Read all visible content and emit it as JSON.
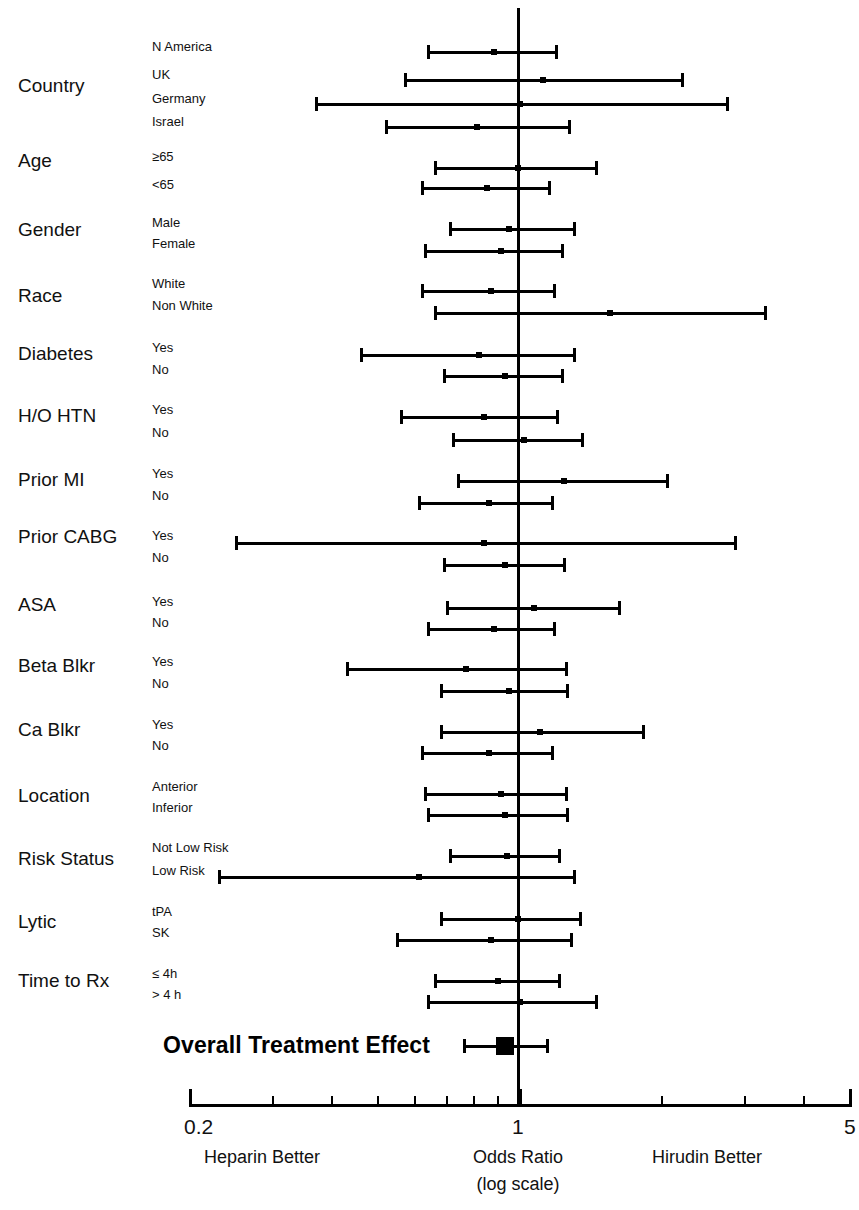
{
  "figure": {
    "title": "",
    "overall_label": "Overall Treatment Effect",
    "axis": {
      "scale": "log",
      "min": 0.2,
      "max": 5,
      "left_tick_label": "0.2",
      "center_tick_label": "1",
      "right_tick_label": "5",
      "ticks": [
        0.2,
        0.3,
        0.4,
        0.5,
        0.6,
        0.7,
        0.8,
        0.9,
        1,
        2,
        3,
        4,
        5
      ],
      "major_ticks": [
        0.2,
        1,
        5
      ],
      "caption_left": "Heparin Better",
      "caption_center": "Odds Ratio",
      "caption_center2": "(log scale)",
      "caption_right": "Hirudin Better",
      "reference_line": 1
    },
    "groups": [
      {
        "label": "Country",
        "strata": [
          "N America",
          "UK",
          "Germany",
          "Israel"
        ]
      },
      {
        "label": "Age",
        "strata": [
          "≥65",
          "<65"
        ]
      },
      {
        "label": "Gender",
        "strata": [
          "Male",
          "Female"
        ]
      },
      {
        "label": "Race",
        "strata": [
          "White",
          "Non White"
        ]
      },
      {
        "label": "Diabetes",
        "strata": [
          "Yes",
          "No"
        ]
      },
      {
        "label": "H/O HTN",
        "strata": [
          "Yes",
          "No"
        ]
      },
      {
        "label": "Prior MI",
        "strata": [
          "Yes",
          "No"
        ]
      },
      {
        "label": "Prior CABG",
        "strata": [
          "Yes",
          "No"
        ]
      },
      {
        "label": "ASA",
        "strata": [
          "Yes",
          "No"
        ]
      },
      {
        "label": "Beta Blkr",
        "strata": [
          "Yes",
          "No"
        ]
      },
      {
        "label": "Ca Blkr",
        "strata": [
          "Yes",
          "No"
        ]
      },
      {
        "label": "Location",
        "strata": [
          "Anterior",
          "Inferior"
        ]
      },
      {
        "label": "Risk Status",
        "strata": [
          "Not Low Risk",
          "Low Risk"
        ]
      },
      {
        "label": "Lytic",
        "strata": [
          "tPA",
          "SK"
        ]
      },
      {
        "label": "Time to Rx",
        "strata": [
          "≤ 4h",
          "> 4 h"
        ]
      }
    ]
  },
  "chart_data": {
    "type": "forest",
    "title": "",
    "xlabel": "Odds Ratio (log scale)",
    "ylabel": "",
    "xscale": "log",
    "xlim": [
      0.2,
      5
    ],
    "reference_line": 1,
    "left_direction_label": "Heparin Better",
    "right_direction_label": "Hirudin Better",
    "grid": false,
    "legend": "none",
    "columns": [
      "group",
      "stratum",
      "odds_ratio",
      "ci_low",
      "ci_high",
      "marker_size"
    ],
    "rows": [
      {
        "group": "Country",
        "stratum": "N America",
        "odds_ratio": 0.88,
        "ci_low": 0.64,
        "ci_high": 1.19,
        "marker_size": 3
      },
      {
        "group": "Country",
        "stratum": "UK",
        "odds_ratio": 1.12,
        "ci_low": 0.57,
        "ci_high": 2.2,
        "marker_size": 3
      },
      {
        "group": "Country",
        "stratum": "Germany",
        "odds_ratio": 1.0,
        "ci_low": 0.37,
        "ci_high": 2.75,
        "marker_size": 3
      },
      {
        "group": "Country",
        "stratum": "Israel",
        "odds_ratio": 0.81,
        "ci_low": 0.52,
        "ci_high": 1.27,
        "marker_size": 3
      },
      {
        "group": "Age",
        "stratum": "≥65",
        "odds_ratio": 0.99,
        "ci_low": 0.66,
        "ci_high": 1.45,
        "marker_size": 3
      },
      {
        "group": "Age",
        "stratum": "<65",
        "odds_ratio": 0.85,
        "ci_low": 0.62,
        "ci_high": 1.15,
        "marker_size": 3
      },
      {
        "group": "Gender",
        "stratum": "Male",
        "odds_ratio": 0.95,
        "ci_low": 0.71,
        "ci_high": 1.3,
        "marker_size": 3
      },
      {
        "group": "Gender",
        "stratum": "Female",
        "odds_ratio": 0.91,
        "ci_low": 0.63,
        "ci_high": 1.23,
        "marker_size": 3
      },
      {
        "group": "Race",
        "stratum": "White",
        "odds_ratio": 0.87,
        "ci_low": 0.62,
        "ci_high": 1.18,
        "marker_size": 3
      },
      {
        "group": "Race",
        "stratum": "Non White",
        "odds_ratio": 1.55,
        "ci_low": 0.66,
        "ci_high": 3.3,
        "marker_size": 3
      },
      {
        "group": "Diabetes",
        "stratum": "Yes",
        "odds_ratio": 0.82,
        "ci_low": 0.46,
        "ci_high": 1.3,
        "marker_size": 3
      },
      {
        "group": "Diabetes",
        "stratum": "No",
        "odds_ratio": 0.93,
        "ci_low": 0.69,
        "ci_high": 1.23,
        "marker_size": 3
      },
      {
        "group": "H/O HTN",
        "stratum": "Yes",
        "odds_ratio": 0.84,
        "ci_low": 0.56,
        "ci_high": 1.2,
        "marker_size": 3
      },
      {
        "group": "H/O HTN",
        "stratum": "No",
        "odds_ratio": 1.02,
        "ci_low": 0.72,
        "ci_high": 1.35,
        "marker_size": 3
      },
      {
        "group": "Prior MI",
        "stratum": "Yes",
        "odds_ratio": 1.24,
        "ci_low": 0.74,
        "ci_high": 2.05,
        "marker_size": 3
      },
      {
        "group": "Prior MI",
        "stratum": "No",
        "odds_ratio": 0.86,
        "ci_low": 0.61,
        "ci_high": 1.17,
        "marker_size": 3
      },
      {
        "group": "Prior CABG",
        "stratum": "Yes",
        "odds_ratio": 0.84,
        "ci_low": 0.25,
        "ci_high": 2.85,
        "marker_size": 3
      },
      {
        "group": "Prior CABG",
        "stratum": "No",
        "odds_ratio": 0.93,
        "ci_low": 0.69,
        "ci_high": 1.24,
        "marker_size": 3
      },
      {
        "group": "ASA",
        "stratum": "Yes",
        "odds_ratio": 1.07,
        "ci_low": 0.7,
        "ci_high": 1.62,
        "marker_size": 3
      },
      {
        "group": "ASA",
        "stratum": "No",
        "odds_ratio": 0.88,
        "ci_low": 0.64,
        "ci_high": 1.18,
        "marker_size": 3
      },
      {
        "group": "Beta Blkr",
        "stratum": "Yes",
        "odds_ratio": 0.77,
        "ci_low": 0.43,
        "ci_high": 1.25,
        "marker_size": 3
      },
      {
        "group": "Beta Blkr",
        "stratum": "No",
        "odds_ratio": 0.95,
        "ci_low": 0.68,
        "ci_high": 1.26,
        "marker_size": 3
      },
      {
        "group": "Ca Blkr",
        "stratum": "Yes",
        "odds_ratio": 1.1,
        "ci_low": 0.68,
        "ci_high": 1.82,
        "marker_size": 3
      },
      {
        "group": "Ca Blkr",
        "stratum": "No",
        "odds_ratio": 0.86,
        "ci_low": 0.62,
        "ci_high": 1.17,
        "marker_size": 3
      },
      {
        "group": "Location",
        "stratum": "Anterior",
        "odds_ratio": 0.91,
        "ci_low": 0.63,
        "ci_high": 1.25,
        "marker_size": 3
      },
      {
        "group": "Location",
        "stratum": "Inferior",
        "odds_ratio": 0.93,
        "ci_low": 0.64,
        "ci_high": 1.26,
        "marker_size": 3
      },
      {
        "group": "Risk Status",
        "stratum": "Not Low Risk",
        "odds_ratio": 0.94,
        "ci_low": 0.71,
        "ci_high": 1.21,
        "marker_size": 3
      },
      {
        "group": "Risk Status",
        "stratum": "Low Risk",
        "odds_ratio": 0.61,
        "ci_low": 0.23,
        "ci_high": 1.3,
        "marker_size": 3
      },
      {
        "group": "Lytic",
        "stratum": "tPA",
        "odds_ratio": 0.99,
        "ci_low": 0.68,
        "ci_high": 1.34,
        "marker_size": 3
      },
      {
        "group": "Lytic",
        "stratum": "SK",
        "odds_ratio": 0.87,
        "ci_low": 0.55,
        "ci_high": 1.28,
        "marker_size": 3
      },
      {
        "group": "Time to Rx",
        "stratum": "≤ 4h",
        "odds_ratio": 0.9,
        "ci_low": 0.66,
        "ci_high": 1.21,
        "marker_size": 3
      },
      {
        "group": "Time to Rx",
        "stratum": "> 4 h",
        "odds_ratio": 1.0,
        "ci_low": 0.64,
        "ci_high": 1.45,
        "marker_size": 3
      }
    ],
    "overall": {
      "label": "Overall Treatment Effect",
      "odds_ratio": 0.93,
      "ci_low": 0.76,
      "ci_high": 1.14,
      "marker_size": 9
    }
  },
  "layout": {
    "plot_left_px": 190,
    "plot_right_px": 850,
    "center_px": 518,
    "row_y": [
      52,
      80,
      104,
      127,
      168,
      188,
      229,
      251,
      291,
      313,
      355,
      376,
      417,
      440,
      481,
      503,
      543,
      565,
      608,
      629,
      669,
      691,
      732,
      753,
      794,
      815,
      856,
      877,
      919,
      940,
      981,
      1002
    ],
    "overall_y": 1046,
    "axis_y": 1104,
    "group_label_y": [
      85,
      160,
      229,
      295,
      353,
      415,
      479,
      536,
      604,
      665,
      729,
      795,
      858,
      921,
      980
    ],
    "sub_label_y": [
      46,
      74,
      98,
      121,
      156,
      184,
      222,
      243,
      283,
      305,
      347,
      369,
      409,
      432,
      473,
      495,
      535,
      557,
      601,
      622,
      661,
      683,
      724,
      745,
      786,
      807,
      847,
      870,
      911,
      932,
      973,
      994
    ]
  }
}
